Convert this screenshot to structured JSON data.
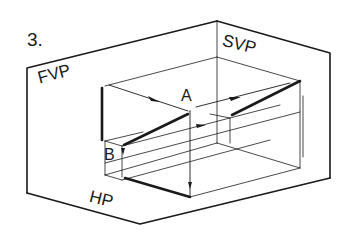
{
  "figure": {
    "number": "3.",
    "planes": {
      "frontal": "FVP",
      "side": "SVP",
      "horizontal": "HP"
    },
    "points": {
      "a": "A",
      "b": "B"
    },
    "colors": {
      "line": "#1a1a1a",
      "background": "#ffffff"
    }
  }
}
